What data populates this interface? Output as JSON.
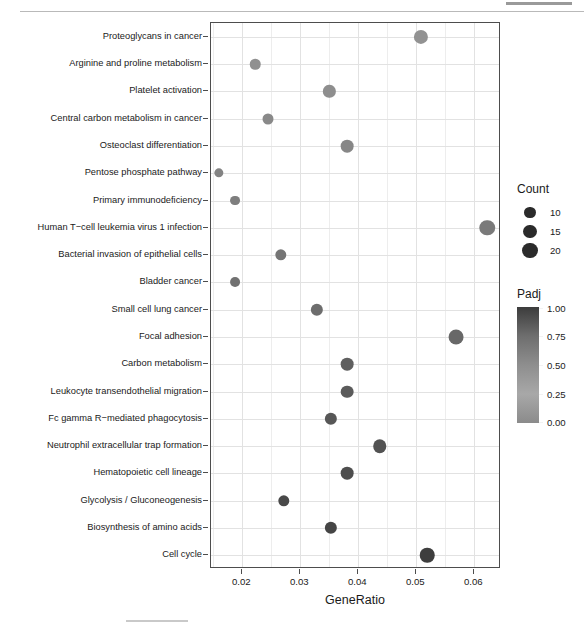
{
  "chart_data": {
    "type": "scatter",
    "title": "",
    "xlabel": "GeneRatio",
    "ylabel": "",
    "xlim": [
      0.0146,
      0.0646
    ],
    "xticks": [
      0.02,
      0.03,
      0.04,
      0.05,
      0.06
    ],
    "xticklabels": [
      "0.02",
      "0.03",
      "0.04",
      "0.05",
      "0.06"
    ],
    "grid": true,
    "legend_position": "right",
    "size_legend": {
      "title": "Count",
      "values": [
        10,
        15,
        20
      ],
      "labels": [
        "10",
        "15",
        "20"
      ]
    },
    "color_legend": {
      "title": "Padj",
      "ticks": [
        1.0,
        0.75,
        0.5,
        0.25,
        0.0
      ],
      "labels": [
        "1.00",
        "0.75",
        "0.50",
        "0.25",
        "0.00"
      ],
      "scale_low_color": "#3c3c3c",
      "scale_high_color": "#a8a8a8"
    },
    "categories": [
      "Proteoglycans in cancer",
      "Arginine and proline metabolism",
      "Platelet activation",
      "Central carbon metabolism in cancer",
      "Osteoclast differentiation",
      "Pentose phosphate pathway",
      "Primary immunodeficiency",
      "Human T−cell leukemia virus 1 infection",
      "Bacterial invasion of epithelial cells",
      "Bladder cancer",
      "Small cell lung cancer",
      "Focal adhesion",
      "Carbon metabolism",
      "Leukocyte transendothelial migration",
      "Fc gamma R−mediated phagocytosis",
      "Neutrophil extracellular trap formation",
      "Hematopoietic cell lineage",
      "Glycolysis / Gluconeogenesis",
      "Biosynthesis of amino acids",
      "Cell cycle"
    ],
    "points": [
      {
        "pathway": "Proteoglycans in cancer",
        "gene_ratio": 0.0508,
        "count": 16,
        "padj": 0.8
      },
      {
        "pathway": "Arginine and proline metabolism",
        "gene_ratio": 0.0222,
        "count": 7,
        "padj": 0.78
      },
      {
        "pathway": "Platelet activation",
        "gene_ratio": 0.035,
        "count": 11,
        "padj": 0.76
      },
      {
        "pathway": "Central carbon metabolism in cancer",
        "gene_ratio": 0.0244,
        "count": 8,
        "padj": 0.72
      },
      {
        "pathway": "Osteoclast differentiation",
        "gene_ratio": 0.0381,
        "count": 12,
        "padj": 0.7
      },
      {
        "pathway": "Pentose phosphate pathway",
        "gene_ratio": 0.016,
        "count": 5,
        "padj": 0.66
      },
      {
        "pathway": "Primary immunodeficiency",
        "gene_ratio": 0.0188,
        "count": 6,
        "padj": 0.62
      },
      {
        "pathway": "Human T−cell leukemia virus 1 infection",
        "gene_ratio": 0.0622,
        "count": 20,
        "padj": 0.58
      },
      {
        "pathway": "Bacterial invasion of epithelial cells",
        "gene_ratio": 0.0266,
        "count": 9,
        "padj": 0.54
      },
      {
        "pathway": "Bladder cancer",
        "gene_ratio": 0.0188,
        "count": 6,
        "padj": 0.5
      },
      {
        "pathway": "Small cell lung cancer",
        "gene_ratio": 0.0328,
        "count": 11,
        "padj": 0.46
      },
      {
        "pathway": "Focal adhesion",
        "gene_ratio": 0.0569,
        "count": 18,
        "padj": 0.42
      },
      {
        "pathway": "Carbon metabolism",
        "gene_ratio": 0.0381,
        "count": 12,
        "padj": 0.34
      },
      {
        "pathway": "Leukocyte transendothelial migration",
        "gene_ratio": 0.0381,
        "count": 12,
        "padj": 0.3
      },
      {
        "pathway": "Fc gamma R−mediated phagocytosis",
        "gene_ratio": 0.0353,
        "count": 11,
        "padj": 0.26
      },
      {
        "pathway": "Neutrophil extracellular trap formation",
        "gene_ratio": 0.0437,
        "count": 14,
        "padj": 0.22
      },
      {
        "pathway": "Hematopoietic cell lineage",
        "gene_ratio": 0.0381,
        "count": 12,
        "padj": 0.18
      },
      {
        "pathway": "Glycolysis / Gluconeogenesis",
        "gene_ratio": 0.0272,
        "count": 9,
        "padj": 0.14
      },
      {
        "pathway": "Biosynthesis of amino acids",
        "gene_ratio": 0.0353,
        "count": 11,
        "padj": 0.1
      },
      {
        "pathway": "Cell cycle",
        "gene_ratio": 0.0519,
        "count": 17,
        "padj": 0.04
      }
    ]
  }
}
